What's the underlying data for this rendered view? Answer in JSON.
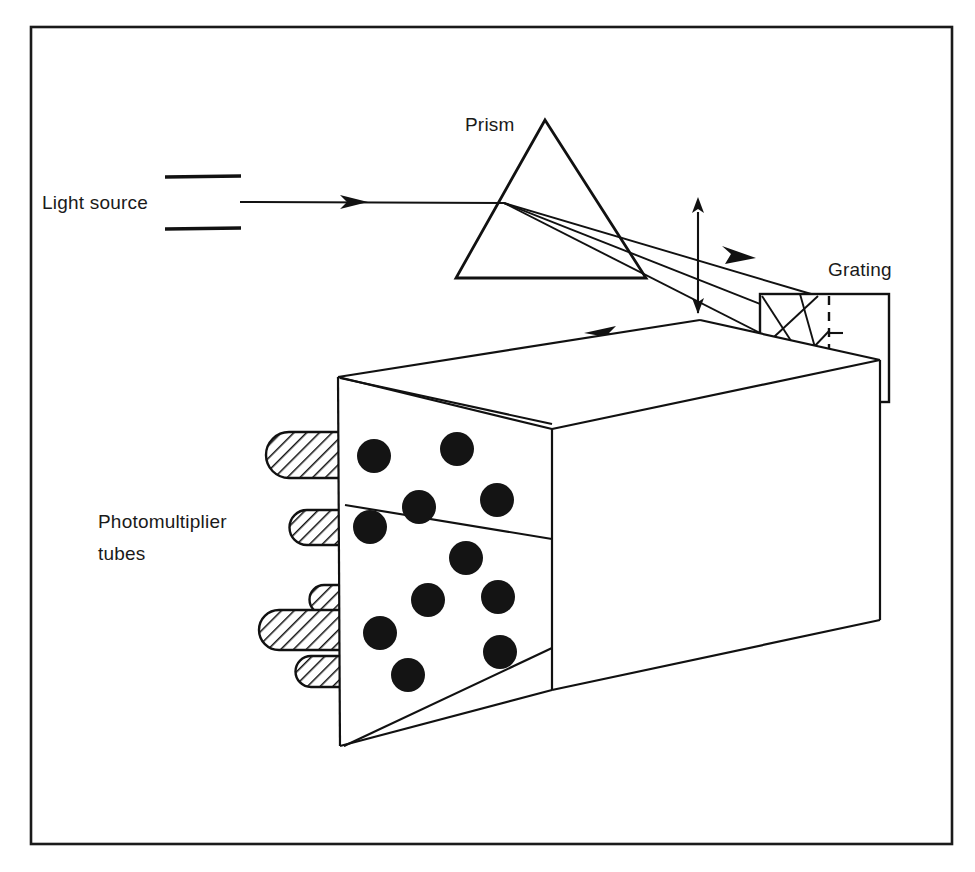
{
  "figure": {
    "background_color": "#ffffff",
    "ink_color": "#111111",
    "border": {
      "x": 31,
      "y": 27,
      "width": 921,
      "height": 817,
      "stroke_width": 2.6
    }
  },
  "labels": [
    {
      "id": "light-source",
      "text": "Light source",
      "x": 42,
      "y": 208,
      "anchor": "start"
    },
    {
      "id": "prism",
      "text": "Prism",
      "x": 465,
      "y": 130,
      "anchor": "start"
    },
    {
      "id": "grating",
      "text": "Grating",
      "x": 828,
      "y": 276,
      "anchor": "start"
    },
    {
      "id": "photomultiplier-line1",
      "text": "Photomultiplier",
      "x": 98,
      "y": 528,
      "anchor": "start"
    },
    {
      "id": "photomultiplier-line2",
      "text": "tubes",
      "x": 98,
      "y": 560,
      "anchor": "start"
    }
  ],
  "light_source": {
    "slit_top": {
      "x1": 165,
      "y1": 177,
      "x2": 241,
      "y2": 177
    },
    "slit_bottom": {
      "x1": 165,
      "y1": 228,
      "x2": 241,
      "y2": 228
    },
    "beam": {
      "x1": 240,
      "y1": 202,
      "x2": 504,
      "y2": 203
    },
    "arrow_at_x": 356
  },
  "prism": {
    "apex": {
      "x": 545,
      "y": 120
    },
    "base_left": {
      "x": 456,
      "y": 278
    },
    "base_right": {
      "x": 646,
      "y": 278
    },
    "entry_point": {
      "x": 504,
      "y": 203
    }
  },
  "grating": {
    "box": {
      "x": 760,
      "y": 294,
      "width": 129,
      "height": 108
    },
    "dashed_line_x": 829,
    "tick_marks_x2": 841,
    "ticks_y": [
      333,
      366
    ],
    "incidence_point": {
      "x": 815,
      "y": 295
    },
    "exit_point": {
      "x": 830,
      "y": 401
    }
  },
  "dispersed_rays": {
    "count": 3,
    "origin": {
      "x": 504,
      "y": 203
    },
    "targets": [
      {
        "x": 815,
        "y": 296
      },
      {
        "x": 828,
        "y": 330
      },
      {
        "x": 829,
        "y": 368
      }
    ]
  },
  "detector_box": {
    "front_top_left": {
      "x": 338,
      "y": 377
    },
    "front_bottom_left": {
      "x": 340,
      "y": 746
    },
    "front_top_right": {
      "x": 552,
      "y": 429
    },
    "front_bottom_right": {
      "x": 552,
      "y": 690
    },
    "back_top": {
      "x": 700,
      "y": 320
    },
    "back_right_top": {
      "x": 880,
      "y": 360
    },
    "note": "isometric rectangular housing with detector face"
  },
  "pmt_dots": {
    "radius": 17,
    "count": 11,
    "positions": [
      {
        "x": 374,
        "y": 456
      },
      {
        "x": 457,
        "y": 449
      },
      {
        "x": 419,
        "y": 507
      },
      {
        "x": 497,
        "y": 500
      },
      {
        "x": 370,
        "y": 527
      },
      {
        "x": 466,
        "y": 558
      },
      {
        "x": 428,
        "y": 600
      },
      {
        "x": 498,
        "y": 597
      },
      {
        "x": 380,
        "y": 633
      },
      {
        "x": 500,
        "y": 652
      },
      {
        "x": 408,
        "y": 675
      }
    ]
  },
  "pmt_tubes": {
    "count": 5,
    "hatch_angle_deg": 45,
    "items": [
      {
        "x": 266,
        "y": 432,
        "width": 76,
        "height": 46
      },
      {
        "x": 289,
        "y": 510,
        "width": 54,
        "height": 35
      },
      {
        "x": 310,
        "y": 585,
        "width": 34,
        "height": 29
      },
      {
        "x": 259,
        "y": 610,
        "width": 85,
        "height": 40
      },
      {
        "x": 296,
        "y": 656,
        "width": 48,
        "height": 31
      }
    ]
  },
  "return_rays": {
    "description": "Diffracted beams returning from grating to photomultiplier face",
    "origin": {
      "x": 830,
      "y": 401
    },
    "paths": [
      {
        "id": "return-ray-upper",
        "to_x": 340,
        "to_y": 378,
        "arrow_x": 597,
        "arrow_y": 333
      },
      {
        "id": "return-ray-middle",
        "to_x": 345,
        "to_y": 500,
        "arrow_x": 634,
        "arrow_y": 487
      },
      {
        "id": "return-ray-lower",
        "to_x": 344,
        "to_y": 746,
        "arrow_x": 679,
        "arrow_y": 565
      }
    ]
  },
  "double_arrows": [
    {
      "id": "vertical-scan-arrow",
      "orientation": "vertical",
      "x": 698,
      "y1": 207,
      "y2": 318
    },
    {
      "id": "horizontal-scan-arrow",
      "orientation": "horizontal",
      "y": 449,
      "x1": 627,
      "x2": 750
    }
  ],
  "single_arrow_rays": [
    {
      "id": "incident-ray-arrow",
      "x": 356,
      "y": 202,
      "direction": "right"
    },
    {
      "id": "prism-output-arrow",
      "x": 752,
      "y": 262,
      "direction": "right-down"
    }
  ]
}
